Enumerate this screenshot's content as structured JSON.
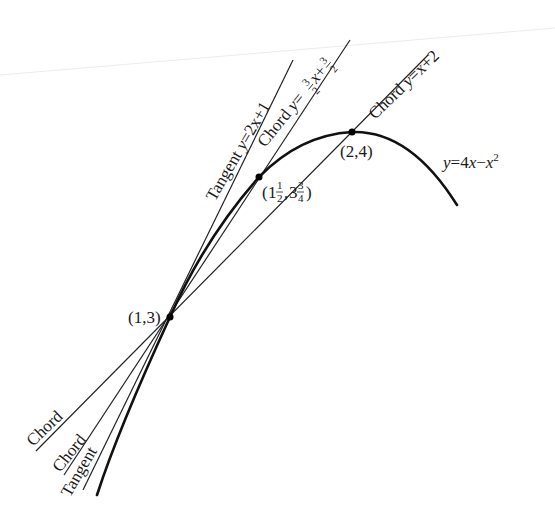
{
  "figure": {
    "curve": {
      "equation_prefix": "y",
      "equation_eq": "=4",
      "equation_x1": "x",
      "equation_minus": "−",
      "equation_x2": "x",
      "equation_exp": "2",
      "stroke": "#111111"
    },
    "points": [
      {
        "label": "(1,3)",
        "x": 1,
        "y": 3
      },
      {
        "label_whole_x": "1",
        "label_num_x": "1",
        "label_den_x": "2",
        "label_whole_y": "3",
        "label_num_y": "3",
        "label_den_y": "4",
        "x": 1.5,
        "y": 3.75
      },
      {
        "label": "(2,4)",
        "x": 2,
        "y": 4
      }
    ],
    "lines": {
      "tangent": {
        "name": "Tangent",
        "eq_y": "y",
        "eq_rest": "=2x+1",
        "low_label": "Tangent"
      },
      "chord_mid": {
        "name": "Chord",
        "eq_y": "y",
        "eq_eq": "=",
        "eq_num": "3",
        "eq_den": "2",
        "eq_x": "x+",
        "eq_num2": "3",
        "eq_den2": "2",
        "low_label": "Chord"
      },
      "chord_far": {
        "name": "Chord",
        "eq_y": "y",
        "eq_rest": "=x+2",
        "low_label": "Chord"
      }
    },
    "line_color": "#222222",
    "point_color": "#000000"
  }
}
